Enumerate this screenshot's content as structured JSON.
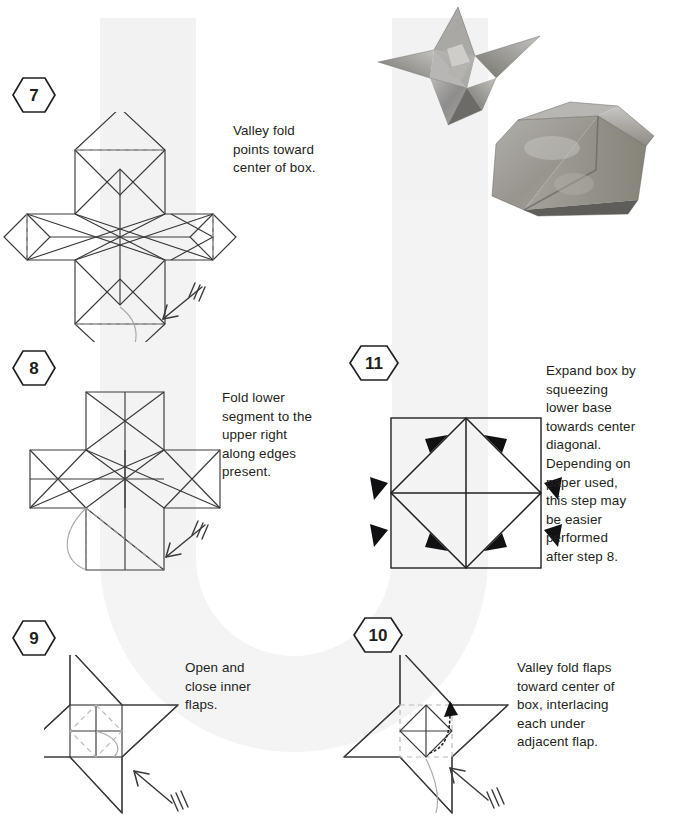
{
  "document": {
    "type": "origami-instructions",
    "title": "Origami box folding steps",
    "ink_color": "#231f20",
    "crease_color": "#b9b9bd",
    "watermark_glyph": "U"
  },
  "steps": [
    {
      "id": "step-7",
      "number": "7",
      "caption": "Valley fold\npoints toward\ncenter of box.",
      "diagram": "cross-blintz-with-points",
      "fold_arrow": {
        "direction": "down-left",
        "hash_marks": 3
      }
    },
    {
      "id": "step-8",
      "number": "8",
      "caption": "Fold lower\nsegment to the\nupper right\nalong edges\npresent.",
      "diagram": "cross-folded-points",
      "fold_arrow": {
        "direction": "down-left",
        "hash_marks": 3
      }
    },
    {
      "id": "step-11",
      "number": "11",
      "caption": "Expand box by\nsqueezing\nlower base\ntowards center\ndiagonal.\nDepending on\npaper used,\nthis step may\nbe easier\nperformed\nafter step 8.",
      "diagram": "square-with-inscribed-diamond",
      "squeeze_arrows": 8
    },
    {
      "id": "step-9",
      "number": "9",
      "caption": "Open and\nclose inner\nflaps.",
      "diagram": "pinwheel-open-flaps",
      "fold_arrow": {
        "direction": "up-left",
        "hash_marks": 3
      }
    },
    {
      "id": "step-10",
      "number": "10",
      "caption": "Valley fold flaps\ntoward center of\nbox, interlacing\neach under\nadjacent flap.",
      "diagram": "pinwheel-interlace",
      "fold_arrow": {
        "direction": "up-left",
        "hash_marks": 3
      }
    }
  ],
  "photos": [
    {
      "id": "photo-star-box",
      "label": "folded star box, open view"
    },
    {
      "id": "photo-closed-box",
      "label": "folded box, closed view"
    }
  ]
}
